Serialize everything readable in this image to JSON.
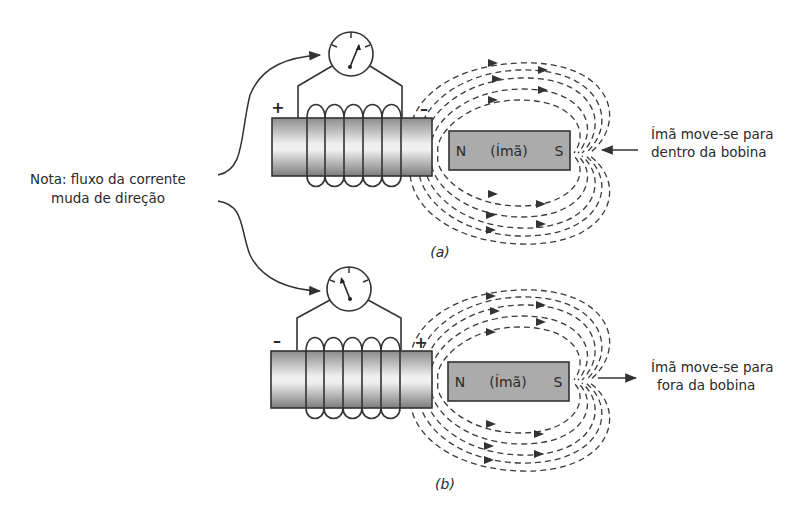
{
  "note": {
    "line1": "Nota: fluxo da corrente",
    "line2": "muda de direção"
  },
  "panel_a": {
    "caption": "(a)",
    "coil_left_sign": "+",
    "coil_right_sign": "–",
    "magnet_north": "N",
    "magnet_label": "(Ímã)",
    "magnet_south": "S",
    "motion_line1": "Ímã move-se para",
    "motion_line2": "dentro da bobina",
    "motion_direction": "left"
  },
  "panel_b": {
    "caption": "(b)",
    "coil_left_sign": "–",
    "coil_right_sign": "+",
    "magnet_north": "N",
    "magnet_label": "(Ímã)",
    "magnet_south": "S",
    "motion_line1": "Ímã move-se para",
    "motion_line2": "fora da bobina",
    "motion_direction": "right"
  },
  "colors": {
    "line": "#333333",
    "magnet_fill": "#a9a9a9",
    "coil_core_dark": "#8a8a8a",
    "coil_core_light": "#f2f2f2"
  }
}
